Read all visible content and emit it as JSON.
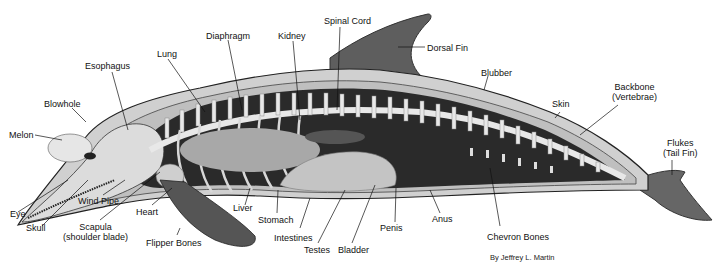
{
  "credit": "By Jeffrey L. Martin",
  "labels": {
    "melon": "Melon",
    "blowhole": "Blowhole",
    "esophagus": "Esophagus",
    "lung": "Lung",
    "diaphragm": "Diaphragm",
    "kidney": "Kidney",
    "spinal_cord": "Spinal Cord",
    "dorsal_fin": "Dorsal Fin",
    "blubber": "Blubber",
    "skin": "Skin",
    "backbone_l1": "Backbone",
    "backbone_l2": "(Vertebrae)",
    "flukes_l1": "Flukes",
    "flukes_l2": "(Tail Fin)",
    "eye": "Eye",
    "skull": "Skull",
    "wind_pipe": "Wind Pipe",
    "scapula_l1": "Scapula",
    "scapula_l2": "(shoulder blade)",
    "heart": "Heart",
    "flipper_bones": "Flipper Bones",
    "liver": "Liver",
    "stomach": "Stomach",
    "intestines": "Intestines",
    "testes": "Testes",
    "bladder": "Bladder",
    "penis": "Penis",
    "anus": "Anus",
    "chevron_bones": "Chevron Bones"
  },
  "colors": {
    "body_cavity": "#2a2a2a",
    "skin": "#6a6a6a",
    "blubber": "#c8c8c8",
    "bone": "#e6e6e6",
    "organ": "#bdbdbd",
    "fin": "#5a5a5a"
  }
}
